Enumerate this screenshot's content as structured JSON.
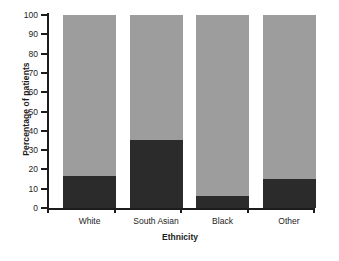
{
  "chart_data": {
    "type": "bar",
    "stacked": true,
    "title": "",
    "xlabel": "Ethnicity",
    "ylabel": "Percentage of patients",
    "categories": [
      "White",
      "South Asian",
      "Black",
      "Other"
    ],
    "ylim": [
      0,
      100
    ],
    "yticks": [
      0,
      10,
      20,
      30,
      40,
      50,
      60,
      70,
      80,
      90,
      100
    ],
    "grid": false,
    "legend": "none",
    "series": [
      {
        "name": "lower-segment",
        "color": "#2b2b2b",
        "values": [
          16.5,
          35.5,
          6.0,
          15.0
        ]
      },
      {
        "name": "upper-segment",
        "color": "#9d9d9d",
        "values": [
          83.5,
          64.5,
          94.0,
          85.0
        ]
      }
    ]
  },
  "colors": {
    "dark": "#2b2b2b",
    "gray": "#9d9d9d",
    "axis": "#1c1c1c",
    "background": "#ffffff"
  }
}
